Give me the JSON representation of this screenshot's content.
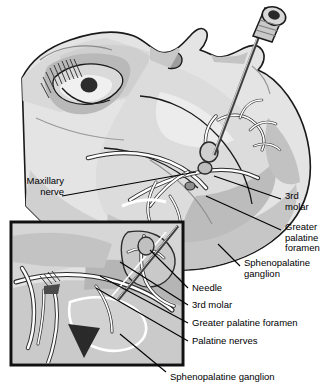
{
  "figure": {
    "type": "medical-illustration",
    "view": "lateral face with magnified inset",
    "palette": {
      "background": "#ffffff",
      "skin_light": "#e9e9e9",
      "skin_mid": "#d2d2d2",
      "skin_shadow": "#b4b4b4",
      "skin_deep": "#9a9a9a",
      "outline": "#1a1a1a",
      "nerve_stroke": "#ffffff",
      "nerve_outline": "#2b2b2b",
      "dark_wedge": "#2a2a2a",
      "metal_light": "#d8d8d8",
      "metal_mid": "#a8a8a8",
      "metal_dark": "#4a4a4a"
    }
  },
  "labels": {
    "maxillary_nerve": "Maxillary\nnerve",
    "third_molar_main": "3rd\nmolar",
    "greater_palatine_foramen_main": "Greater\npalatine\nforamen",
    "sphenopalatine_ganglion_main": "Sphenopalatine\nganglion",
    "needle_inset": "Needle",
    "third_molar_inset": "3rd molar",
    "greater_palatine_foramen_inset": "Greater palatine foramen",
    "palatine_nerves_inset": "Palatine nerves",
    "sphenopalatine_ganglion_inset": "Sphenopalatine ganglion"
  },
  "inset": {
    "name": "magnified-detail-box",
    "bounds": {
      "x": 11,
      "y": 222,
      "width": 172,
      "height": 143
    }
  },
  "instrument": {
    "name": "syringe-needle",
    "hub_position": {
      "x": 269,
      "y": 20
    },
    "tip_position": {
      "x": 214,
      "y": 155
    }
  }
}
